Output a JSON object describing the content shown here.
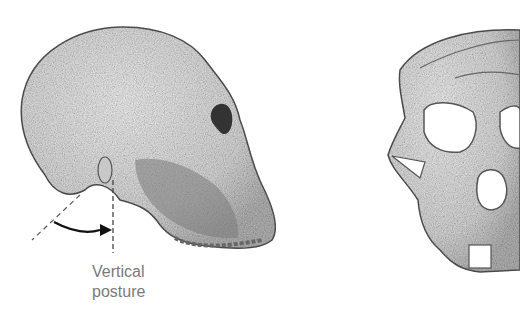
{
  "figure": {
    "side_skull": {
      "label": "lateral-view skull"
    },
    "front_skull": {
      "label": "frontal-view skull"
    },
    "annotation": {
      "line1": "Vertical",
      "line2": "posture"
    },
    "colors": {
      "bone": "#e6e6e6",
      "outline": "#555555",
      "shade": "#9a9a9a",
      "label": "#7a7a7a"
    }
  }
}
